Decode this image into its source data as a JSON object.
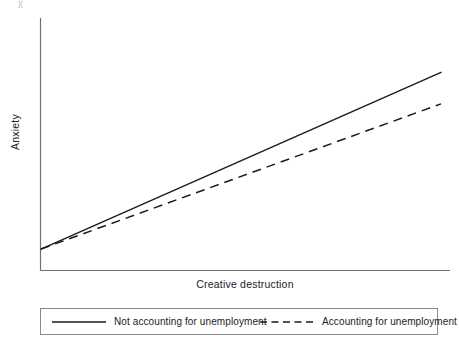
{
  "chart_data": {
    "type": "line",
    "title": "",
    "xlabel": "Creative destruction",
    "ylabel": "Anxiety",
    "xlim": [
      0,
      1
    ],
    "ylim": [
      0,
      1
    ],
    "grid": false,
    "axis_ticks": false,
    "legend_position": "below-plot",
    "x": [
      0,
      1
    ],
    "series": [
      {
        "name": "Not accounting for unemployment",
        "style": "solid",
        "color": "#1a1a1a",
        "values": [
          0.085,
          0.785
        ]
      },
      {
        "name": "Accounting for unemployment",
        "style": "dashed",
        "color": "#1a1a1a",
        "values": [
          0.085,
          0.66
        ]
      }
    ],
    "annotations": []
  },
  "axes": {
    "ylabel": "Anxiety",
    "xlabel": "Creative destruction"
  },
  "legend": {
    "entries": [
      {
        "label": "Not accounting for unemployment",
        "style": "solid"
      },
      {
        "label": "Accounting for unemployment",
        "style": "dashed"
      }
    ]
  },
  "colors": {
    "line": "#1a1a1a",
    "axis": "#707070",
    "legend_border": "#8a8a8a",
    "background": "#ffffff"
  }
}
